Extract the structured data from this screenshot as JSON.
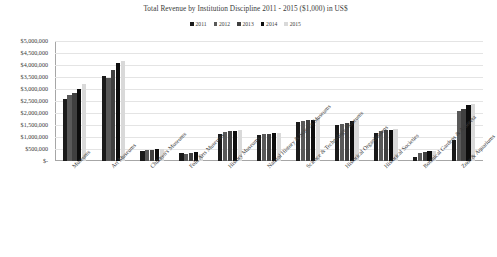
{
  "chart_data": {
    "type": "bar",
    "title": "Total Revenue by Institution Discipline 2011 - 2015 ($1,000) in US$",
    "xlabel": "",
    "ylabel": "",
    "ylim": [
      0,
      5000000
    ],
    "ytick_step": 500000,
    "ytick_labels": [
      "$5,000,000",
      "$4,500,000",
      "$4,000,000",
      "$3,500,000",
      "$3,000,000",
      "$2,500,000",
      "$2,000,000",
      "$1,500,000",
      "$1,000,000",
      "$500,000",
      "$-"
    ],
    "grid": true,
    "legend_position": "top",
    "categories": [
      "Museums",
      "Art Museums",
      "Children's Museums",
      "Folk Arts Museums",
      "History Museums",
      "Natural History & Science Museums",
      "Science & Technology Museums",
      "Historical Organizations",
      "Historical Societies",
      "Botanical Gardens & Arboreta",
      "Zoos & Aquariums"
    ],
    "series": [
      {
        "name": "2011",
        "color": "#1a1a1a",
        "values": [
          2600000,
          3550000,
          420000,
          330000,
          1130000,
          1100000,
          1620000,
          1480000,
          1170000,
          180000,
          880000
        ]
      },
      {
        "name": "2012",
        "color": "#595959",
        "values": [
          2750000,
          3450000,
          460000,
          300000,
          1190000,
          1120000,
          1680000,
          1550000,
          1250000,
          340000,
          2100000
        ]
      },
      {
        "name": "2013",
        "color": "#404040",
        "values": [
          2850000,
          3800000,
          470000,
          340000,
          1230000,
          1130000,
          1690000,
          1580000,
          1290000,
          390000,
          2150000
        ]
      },
      {
        "name": "2014",
        "color": "#0d0d0d",
        "values": [
          3000000,
          4100000,
          480000,
          360000,
          1260000,
          1150000,
          1720000,
          1660000,
          1310000,
          430000,
          2350000
        ]
      },
      {
        "name": "2015",
        "color": "#d9d9d9",
        "values": [
          3200000,
          4150000,
          500000,
          290000,
          1280000,
          1180000,
          1790000,
          1700000,
          1320000,
          420000,
          2380000
        ]
      }
    ]
  }
}
